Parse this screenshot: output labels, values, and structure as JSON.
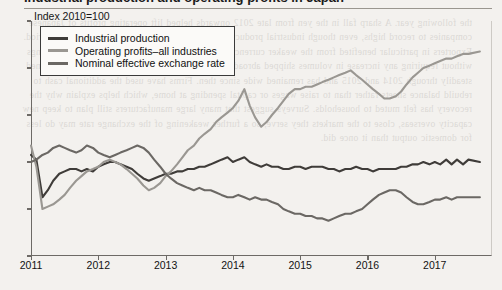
{
  "figure": {
    "title": "Industrial production and operating profits in Japan",
    "axis_note": "Index 2010=100"
  },
  "legend": [
    {
      "label": "Industrial production",
      "color": "#3f3c39",
      "key": "industrial_production"
    },
    {
      "label": "Operating profits–all industries",
      "color": "#9a9792",
      "key": "operating_profits"
    },
    {
      "label": "Nominal effective exchange rate",
      "color": "#6b6864",
      "key": "exchange_rate"
    }
  ],
  "ghost": "the following year. A sharp fall in the yen from late 2012 onwards helped lift operating profits of Japanese companies to record highs, even though industrial production itself stayed broadly flat over the same period. Exporters in particular benefited from the weaker currency, which raised the yen value of overseas earnings without requiring any increase in volumes shipped abroad. The gap between profits and production widened steadily through 2014 and 2015 and has remained wide since then. Firms have used the additional cash to rebuild balance sheets rather than to raise wages or capital spending at home, which helps explain why the recovery has felt muted to households. Surveys suggest that many large manufacturers still plan to keep new capacity overseas, close to the markets they serve, so a further weakening of the exchange rate may do less for domestic output than it once did.",
  "chart_data": {
    "type": "line",
    "title": "Industrial production and operating profits in Japan",
    "ylabel": "Index 2010=100",
    "xlabel": "",
    "ylim": [
      60,
      160
    ],
    "yticks": [
      60,
      80,
      100,
      120,
      140,
      160
    ],
    "xlim": [
      2011.0,
      2017.85
    ],
    "xticks": [
      2011,
      2012,
      2013,
      2014,
      2015,
      2016,
      2017
    ],
    "grid": false,
    "legend_position": "top-left",
    "x": [
      2011.0,
      2011.08,
      2011.17,
      2011.25,
      2011.33,
      2011.42,
      2011.5,
      2011.58,
      2011.67,
      2011.75,
      2011.83,
      2011.92,
      2012.0,
      2012.08,
      2012.17,
      2012.25,
      2012.33,
      2012.42,
      2012.5,
      2012.58,
      2012.67,
      2012.75,
      2012.83,
      2012.92,
      2013.0,
      2013.08,
      2013.17,
      2013.25,
      2013.33,
      2013.42,
      2013.5,
      2013.58,
      2013.67,
      2013.75,
      2013.83,
      2013.92,
      2014.0,
      2014.08,
      2014.17,
      2014.25,
      2014.33,
      2014.42,
      2014.5,
      2014.58,
      2014.67,
      2014.75,
      2014.83,
      2014.92,
      2015.0,
      2015.08,
      2015.17,
      2015.25,
      2015.33,
      2015.42,
      2015.5,
      2015.58,
      2015.67,
      2015.75,
      2015.83,
      2015.92,
      2016.0,
      2016.08,
      2016.17,
      2016.25,
      2016.33,
      2016.42,
      2016.5,
      2016.58,
      2016.67,
      2016.75,
      2016.83,
      2016.92,
      2017.0,
      2017.08,
      2017.17,
      2017.25,
      2017.33,
      2017.42,
      2017.5,
      2017.67
    ],
    "series": [
      {
        "name": "Industrial production",
        "color": "#3f3c39",
        "values": [
          103,
          101,
          85,
          88,
          92,
          95,
          96,
          97,
          97,
          96,
          97,
          96,
          98,
          99,
          100,
          100,
          99,
          98,
          97,
          95,
          93,
          92,
          93,
          94,
          95,
          95,
          96,
          96,
          97,
          97,
          98,
          98,
          99,
          100,
          101,
          102,
          100,
          101,
          102,
          100,
          99,
          98,
          99,
          98,
          98,
          97,
          97,
          98,
          98,
          97,
          98,
          98,
          98,
          97,
          97,
          96,
          97,
          97,
          98,
          97,
          97,
          96,
          97,
          97,
          97,
          97,
          98,
          98,
          99,
          99,
          100,
          99,
          100,
          99,
          101,
          99,
          101,
          99,
          101,
          100
        ]
      },
      {
        "name": "Operating profits–all industries",
        "color": "#9a9792",
        "values": [
          107,
          98,
          80,
          81,
          82,
          84,
          86,
          89,
          92,
          94,
          96,
          97,
          98,
          100,
          101,
          100,
          99,
          97,
          95,
          93,
          90,
          88,
          89,
          91,
          94,
          96,
          99,
          102,
          105,
          107,
          110,
          112,
          114,
          117,
          119,
          121,
          123,
          126,
          131,
          124,
          119,
          115,
          117,
          120,
          123,
          126,
          129,
          131,
          131,
          132,
          132,
          133,
          134,
          135,
          136,
          137,
          138,
          139,
          137,
          135,
          133,
          131,
          129,
          127,
          127,
          128,
          130,
          133,
          136,
          138,
          140,
          141,
          142,
          143,
          144,
          144,
          145,
          146,
          146,
          147
        ]
      },
      {
        "name": "Nominal effective exchange rate",
        "color": "#6b6864",
        "values": [
          100,
          101,
          103,
          104,
          106,
          107,
          106,
          105,
          104,
          105,
          107,
          106,
          104,
          103,
          102,
          103,
          104,
          105,
          106,
          107,
          106,
          104,
          101,
          98,
          95,
          93,
          91,
          90,
          89,
          88,
          89,
          88,
          88,
          87,
          86,
          85,
          85,
          86,
          85,
          84,
          85,
          84,
          84,
          83,
          82,
          80,
          79,
          78,
          78,
          77,
          77,
          76,
          76,
          75,
          76,
          77,
          78,
          78,
          79,
          80,
          82,
          84,
          86,
          87,
          88,
          88,
          87,
          85,
          83,
          82,
          82,
          83,
          84,
          84,
          85,
          84,
          85,
          85,
          85,
          85
        ]
      }
    ]
  }
}
